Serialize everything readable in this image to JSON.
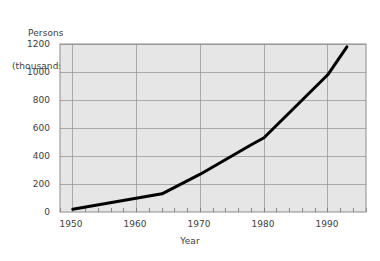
{
  "chart_data": {
    "type": "line",
    "title": "",
    "xlabel": "Year",
    "ylabel": "Persons (thousands)",
    "ylabel_line1": "Persons",
    "ylabel_line2": "(thousands)",
    "xlim": [
      1948,
      1996
    ],
    "ylim": [
      0,
      1200
    ],
    "xticks": [
      1950,
      1960,
      1970,
      1980,
      1990
    ],
    "xtick_labels": [
      "1950",
      "1960",
      "1970",
      "1980",
      "1990"
    ],
    "yticks": [
      0,
      200,
      400,
      600,
      800,
      1000,
      1200
    ],
    "ytick_labels": [
      "0",
      "200",
      "400",
      "600",
      "800",
      "1000",
      "1200"
    ],
    "minor_xticks_per_interval": 5,
    "grid": true,
    "grid_color": "#9a9a9a",
    "plot_background": "#e6e6e6",
    "line_color": "#000000",
    "line_width": 3,
    "legend": false,
    "series": [
      {
        "name": "Persons",
        "x": [
          1950,
          1964,
          1970,
          1978,
          1980,
          1990,
          1993
        ],
        "values": [
          20,
          130,
          270,
          480,
          530,
          980,
          1180
        ]
      }
    ]
  }
}
